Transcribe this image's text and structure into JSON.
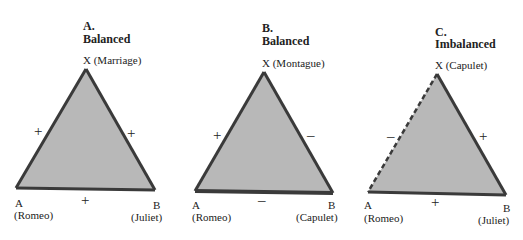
{
  "panels": [
    {
      "letter": "A.",
      "status": "Balanced",
      "apex": "X (Marriage)",
      "left_vertex": "A",
      "left_name": "(Romeo)",
      "right_vertex": "B",
      "right_name": "(Juliet)",
      "sign_left": "+",
      "sign_right": "+",
      "sign_bottom": "+",
      "left_edge_style": "solid"
    },
    {
      "letter": "B.",
      "status": "Balanced",
      "apex": "X (Montague)",
      "left_vertex": "A",
      "left_name": "(Romeo)",
      "right_vertex": "B",
      "right_name": "(Capulet)",
      "sign_left": "+",
      "sign_right": "–",
      "sign_bottom": "–",
      "left_edge_style": "solid"
    },
    {
      "letter": "C.",
      "status": "Imbalanced",
      "apex": "X (Capulet)",
      "left_vertex": "A",
      "left_name": "(Romeo)",
      "right_vertex": "B",
      "right_name": "(Juliet)",
      "sign_left": "–",
      "sign_right": "+",
      "sign_bottom": "+",
      "left_edge_style": "dashed"
    }
  ],
  "colors": {
    "fill": "#b8b8b8",
    "stroke": "#3a3a3a",
    "text": "#222222"
  }
}
